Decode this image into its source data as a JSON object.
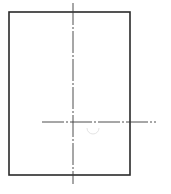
{
  "diagram": {
    "type": "technical-drawing",
    "colors": {
      "background": "#ffffff",
      "outline": "#2a2a2a",
      "centerline": "#3a3a3a",
      "faint_arc": "#e4e4e4"
    },
    "rectangle": {
      "x": 9,
      "y": 12,
      "width": 121,
      "height": 163,
      "stroke_width": 1.6
    },
    "centerlines": [
      {
        "name": "vertical",
        "x1": 73,
        "y1": 3,
        "x2": 73,
        "y2": 184,
        "dash": "22 2 2 2"
      },
      {
        "name": "horizontal",
        "x1": 42,
        "y1": 122,
        "x2": 156,
        "y2": 122,
        "dash": "22 2 2 2"
      }
    ],
    "faint_arc": {
      "cx": 93,
      "cy": 128,
      "r": 6
    }
  }
}
